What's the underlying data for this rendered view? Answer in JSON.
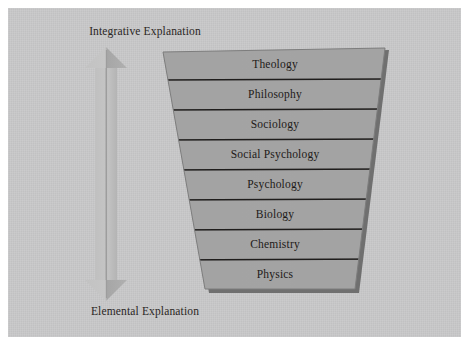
{
  "figure": {
    "type": "hierarchy-funnel-diagram",
    "background_color": "#c8c8c9",
    "shape_fill_color": "#9b9b9b",
    "shape_shadow_color": "#6f6f6f",
    "arrow_fill_color": "#bdbdbd",
    "text_color": "#1d1a18"
  },
  "axis": {
    "top_label": "Integrative Explanation",
    "bottom_label": "Elemental Explanation"
  },
  "arrow": {
    "name": "double-headed-vertical-arrow",
    "direction": "bidirectional-vertical"
  },
  "levels": [
    {
      "index": 1,
      "label": "Theology"
    },
    {
      "index": 2,
      "label": "Philosophy"
    },
    {
      "index": 3,
      "label": "Sociology"
    },
    {
      "index": 4,
      "label": "Social Psychology"
    },
    {
      "index": 5,
      "label": "Psychology"
    },
    {
      "index": 6,
      "label": "Biology"
    },
    {
      "index": 7,
      "label": "Chemistry"
    },
    {
      "index": 8,
      "label": "Physics"
    }
  ]
}
